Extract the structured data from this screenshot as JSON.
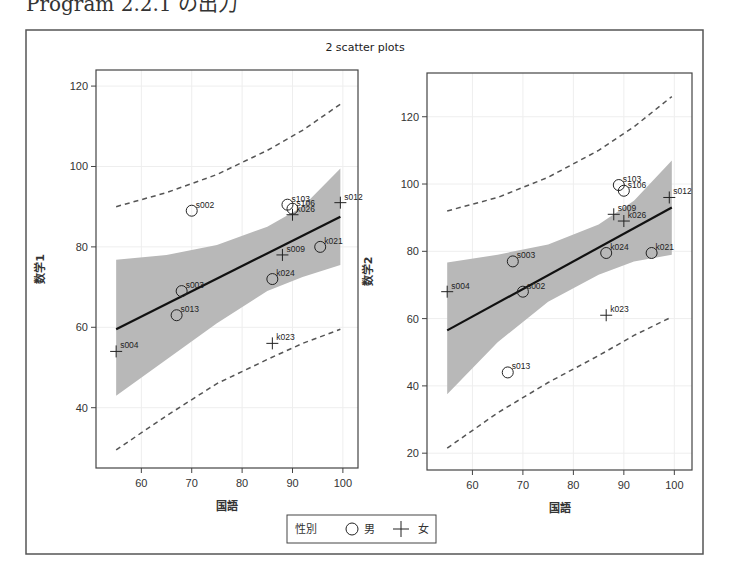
{
  "caption": "Program 2.2.1 の出力",
  "legend": {
    "title": "性別",
    "items": [
      {
        "marker": "circle",
        "label": "男"
      },
      {
        "marker": "plus",
        "label": "女"
      }
    ]
  },
  "colors": {
    "band": "#b8b8b8",
    "line": "#111111",
    "pred": "#555555",
    "frame": "#444444",
    "grid": "#eeeeee"
  },
  "chart_data": [
    {
      "type": "scatter",
      "title": "2 scatter plots",
      "xlabel": "国語",
      "ylabel": "数学1",
      "xlim": [
        51,
        103
      ],
      "ylim": [
        25,
        124
      ],
      "xticks": [
        60,
        70,
        80,
        90,
        100
      ],
      "yticks": [
        40,
        60,
        80,
        100,
        120
      ],
      "grid": true,
      "legend_position": "bottom",
      "points": [
        {
          "id": "s002",
          "x": 70,
          "y": 89,
          "sex": "男"
        },
        {
          "id": "s003",
          "x": 68,
          "y": 69,
          "sex": "男"
        },
        {
          "id": "s013",
          "x": 67,
          "y": 63,
          "sex": "男"
        },
        {
          "id": "s004",
          "x": 55,
          "y": 54,
          "sex": "女"
        },
        {
          "id": "s103",
          "x": 89,
          "y": 90.5,
          "sex": "男"
        },
        {
          "id": "s106",
          "x": 90,
          "y": 89.5,
          "sex": "男"
        },
        {
          "id": "k026",
          "x": 90,
          "y": 88,
          "sex": "女"
        },
        {
          "id": "s012",
          "x": 99.5,
          "y": 91,
          "sex": "女"
        },
        {
          "id": "k021",
          "x": 95.5,
          "y": 80,
          "sex": "男"
        },
        {
          "id": "s009",
          "x": 88,
          "y": 78,
          "sex": "女"
        },
        {
          "id": "k024",
          "x": 86,
          "y": 72,
          "sex": "男"
        },
        {
          "id": "k023",
          "x": 86,
          "y": 56,
          "sex": "女"
        }
      ],
      "regression": {
        "x0": 55,
        "y0": 59.5,
        "x1": 99.5,
        "y1": 87.5
      },
      "confidence_band": {
        "x": [
          55,
          65,
          75,
          85,
          92,
          99.5
        ],
        "upper": [
          76.8,
          78,
          80.5,
          85,
          90,
          99.5
        ],
        "lower": [
          43,
          52,
          61,
          69,
          72.5,
          75.5
        ]
      },
      "prediction_limits": {
        "x": [
          55,
          65,
          75,
          85,
          92,
          99.5
        ],
        "upper": [
          90,
          93.5,
          98,
          104,
          109,
          115.5
        ],
        "lower": [
          29.5,
          38,
          46,
          52,
          56,
          59.5
        ]
      }
    },
    {
      "type": "scatter",
      "title": "2 scatter plots",
      "xlabel": "国語",
      "ylabel": "数学2",
      "xlim": [
        51,
        103.5
      ],
      "ylim": [
        15,
        133
      ],
      "xticks": [
        60,
        70,
        80,
        90,
        100
      ],
      "yticks": [
        20,
        40,
        60,
        80,
        100,
        120
      ],
      "grid": true,
      "legend_position": "bottom",
      "points": [
        {
          "id": "s103",
          "x": 89,
          "y": 99.7,
          "sex": "男"
        },
        {
          "id": "s106",
          "x": 90,
          "y": 98,
          "sex": "男"
        },
        {
          "id": "s012",
          "x": 99,
          "y": 96,
          "sex": "女"
        },
        {
          "id": "s009",
          "x": 88,
          "y": 91,
          "sex": "女"
        },
        {
          "id": "k026",
          "x": 90,
          "y": 89,
          "sex": "女"
        },
        {
          "id": "k024",
          "x": 86.5,
          "y": 79.5,
          "sex": "男"
        },
        {
          "id": "k021",
          "x": 95.5,
          "y": 79.5,
          "sex": "男"
        },
        {
          "id": "s003",
          "x": 68,
          "y": 77,
          "sex": "男"
        },
        {
          "id": "s004",
          "x": 55,
          "y": 68,
          "sex": "女"
        },
        {
          "id": "s002",
          "x": 70,
          "y": 68,
          "sex": "男"
        },
        {
          "id": "k023",
          "x": 86.5,
          "y": 61,
          "sex": "女"
        },
        {
          "id": "s013",
          "x": 67,
          "y": 44,
          "sex": "男"
        }
      ],
      "regression": {
        "x0": 55,
        "y0": 56.5,
        "x1": 99.5,
        "y1": 93
      },
      "confidence_band": {
        "x": [
          55,
          65,
          75,
          85,
          92,
          99.5
        ],
        "upper": [
          76.7,
          79,
          82,
          88,
          95,
          107
        ],
        "lower": [
          37.5,
          53,
          65,
          73,
          77,
          79
        ]
      },
      "prediction_limits": {
        "x": [
          55,
          65,
          75,
          85,
          92,
          99.5
        ],
        "upper": [
          92,
          96,
          102,
          110,
          117,
          126
        ],
        "lower": [
          21.5,
          32,
          41,
          49,
          55,
          60.5
        ]
      }
    }
  ]
}
